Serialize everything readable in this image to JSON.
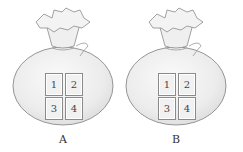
{
  "figure": {
    "bags": [
      {
        "label": "A",
        "cards": [
          "1",
          "2",
          "3",
          "4"
        ]
      },
      {
        "label": "B",
        "cards": [
          "1",
          "2",
          "3",
          "4"
        ]
      }
    ]
  },
  "colors": {
    "bag_fill": "#ececec",
    "bag_outline": "#8a8a8a",
    "card_border": "#8a8a8a"
  }
}
